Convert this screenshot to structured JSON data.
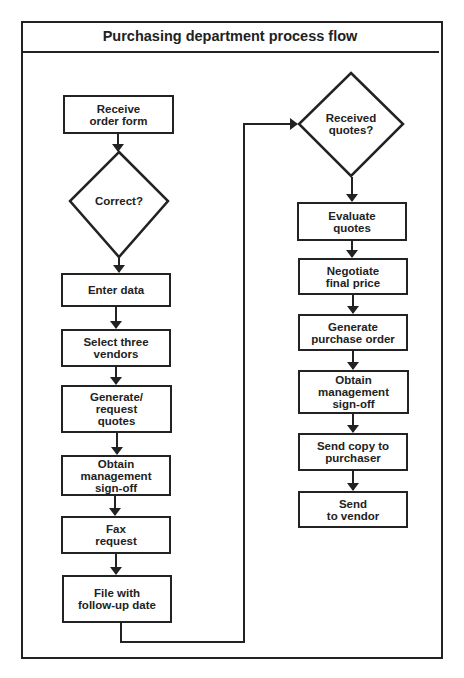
{
  "diagram": {
    "title": "Purchasing department process flow",
    "left_column": {
      "steps": [
        {
          "id": "receive-order-form",
          "type": "process",
          "label": "Receive\norder form"
        },
        {
          "id": "correct",
          "type": "decision",
          "label": "Correct?"
        },
        {
          "id": "enter-data",
          "type": "process",
          "label": "Enter data"
        },
        {
          "id": "select-three-vendors",
          "type": "process",
          "label": "Select three\nvendors"
        },
        {
          "id": "generate-request-quotes",
          "type": "process",
          "label": "Generate/\nrequest\nquotes"
        },
        {
          "id": "obtain-management-signoff-1",
          "type": "process",
          "label": "Obtain\nmanagement\nsign-off"
        },
        {
          "id": "fax-request",
          "type": "process",
          "label": "Fax\nrequest"
        },
        {
          "id": "file-with-followup-date",
          "type": "process",
          "label": "File with\nfollow-up date"
        }
      ]
    },
    "right_column": {
      "steps": [
        {
          "id": "received-quotes",
          "type": "decision",
          "label": "Received\nquotes?"
        },
        {
          "id": "evaluate-quotes",
          "type": "process",
          "label": "Evaluate\nquotes"
        },
        {
          "id": "negotiate-final-price",
          "type": "process",
          "label": "Negotiate\nfinal price"
        },
        {
          "id": "generate-purchase-order",
          "type": "process",
          "label": "Generate\npurchase order"
        },
        {
          "id": "obtain-management-signoff-2",
          "type": "process",
          "label": "Obtain\nmanagement\nsign-off"
        },
        {
          "id": "send-copy-to-purchaser",
          "type": "process",
          "label": "Send copy to\npurchaser"
        },
        {
          "id": "send-to-vendor",
          "type": "process",
          "label": "Send\nto vendor"
        }
      ]
    },
    "connections": [
      {
        "from": "receive-order-form",
        "to": "correct"
      },
      {
        "from": "correct",
        "to": "enter-data"
      },
      {
        "from": "enter-data",
        "to": "select-three-vendors"
      },
      {
        "from": "select-three-vendors",
        "to": "generate-request-quotes"
      },
      {
        "from": "generate-request-quotes",
        "to": "obtain-management-signoff-1"
      },
      {
        "from": "obtain-management-signoff-1",
        "to": "fax-request"
      },
      {
        "from": "fax-request",
        "to": "file-with-followup-date"
      },
      {
        "from": "file-with-followup-date",
        "to": "received-quotes"
      },
      {
        "from": "received-quotes",
        "to": "evaluate-quotes"
      },
      {
        "from": "evaluate-quotes",
        "to": "negotiate-final-price"
      },
      {
        "from": "negotiate-final-price",
        "to": "generate-purchase-order"
      },
      {
        "from": "generate-purchase-order",
        "to": "obtain-management-signoff-2"
      },
      {
        "from": "obtain-management-signoff-2",
        "to": "send-copy-to-purchaser"
      },
      {
        "from": "send-copy-to-purchaser",
        "to": "send-to-vendor"
      }
    ],
    "colors": {
      "stroke": "#222222",
      "background": "#ffffff"
    }
  }
}
